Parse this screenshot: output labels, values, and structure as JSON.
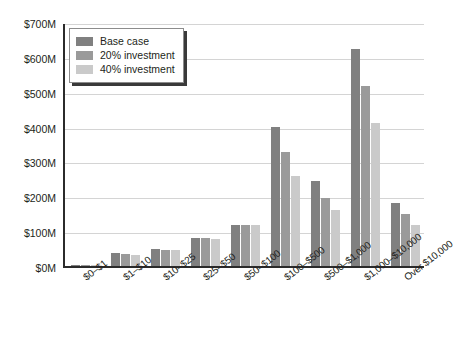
{
  "chart_data": {
    "type": "bar",
    "title": "",
    "xlabel": "",
    "ylabel": "",
    "grid": true,
    "legend_position": "top-left",
    "ylim": [
      0,
      700
    ],
    "y_unit": "$M",
    "y_ticks": [
      0,
      100,
      200,
      300,
      400,
      500,
      600,
      700
    ],
    "y_tick_labels": [
      "$0M",
      "$100M",
      "$200M",
      "$300M",
      "$400M",
      "$500M",
      "$600M",
      "$700M"
    ],
    "categories": [
      "$0–$1",
      "$1–$10",
      "$10–$25",
      "$25–$50",
      "$50–$100",
      "$100–$500",
      "$500–$1,000",
      "$1,000–$10,000",
      "Over $10,000"
    ],
    "series": [
      {
        "name": "Base case",
        "color": "#808080",
        "values": [
          4,
          36,
          48,
          80,
          118,
          398,
          245,
          622,
          180
        ]
      },
      {
        "name": "20% investment",
        "color": "#9a9a9a",
        "values": [
          4,
          35,
          47,
          79,
          118,
          327,
          196,
          516,
          150
        ]
      },
      {
        "name": "40% investment",
        "color": "#cacaca",
        "values": [
          3,
          33,
          45,
          78,
          117,
          258,
          160,
          410,
          118
        ]
      }
    ]
  }
}
